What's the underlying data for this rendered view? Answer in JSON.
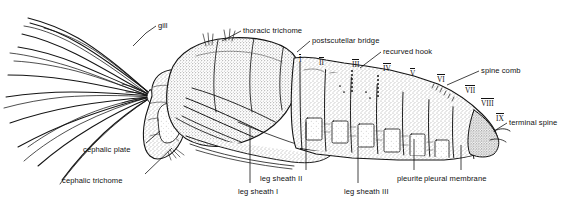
{
  "figure": {
    "view": "lateral",
    "background": "#ffffff",
    "ink": "#111111"
  },
  "labels": [
    {
      "id": "gill",
      "text": "gill",
      "x": 158,
      "y": 22,
      "anchor": "start"
    },
    {
      "id": "thoracic-trichome",
      "text": "thoracic trichome",
      "x": 243,
      "y": 27,
      "anchor": "start"
    },
    {
      "id": "postscutellar",
      "text": "postscutellar bridge",
      "x": 312,
      "y": 37,
      "anchor": "start"
    },
    {
      "id": "recurved-hook",
      "text": "recurved hook",
      "x": 383,
      "y": 48,
      "anchor": "start"
    },
    {
      "id": "spine-comb",
      "text": "spine comb",
      "x": 481,
      "y": 67,
      "anchor": "start"
    },
    {
      "id": "terminal-spine",
      "text": "terminal spine",
      "x": 509,
      "y": 119,
      "anchor": "start"
    },
    {
      "id": "cephalic-plate",
      "text": "cephalic plate",
      "x": 83,
      "y": 146,
      "anchor": "start"
    },
    {
      "id": "cephalic-trichome",
      "text": "cephalic trichome",
      "x": 62,
      "y": 177,
      "anchor": "start"
    },
    {
      "id": "leg-sheath-1",
      "text": "leg sheath I",
      "x": 238,
      "y": 188,
      "anchor": "start"
    },
    {
      "id": "leg-sheath-2",
      "text": "leg sheath II",
      "x": 260,
      "y": 175,
      "anchor": "start"
    },
    {
      "id": "leg-sheath-3",
      "text": "leg sheath III",
      "x": 344,
      "y": 188,
      "anchor": "start"
    },
    {
      "id": "pleurite",
      "text": "pleurite",
      "x": 397,
      "y": 175,
      "anchor": "start"
    },
    {
      "id": "pleural-membrane",
      "text": "pleural membrane",
      "x": 424,
      "y": 175,
      "anchor": "start"
    }
  ],
  "segments": [
    {
      "numeral": "I",
      "x": 299,
      "y": 54
    },
    {
      "numeral": "II",
      "x": 319,
      "y": 57
    },
    {
      "numeral": "III",
      "x": 352,
      "y": 59
    },
    {
      "numeral": "IV",
      "x": 383,
      "y": 63
    },
    {
      "numeral": "V",
      "x": 410,
      "y": 68
    },
    {
      "numeral": "VI",
      "x": 437,
      "y": 74
    },
    {
      "numeral": "VII",
      "x": 465,
      "y": 85
    },
    {
      "numeral": "VIII",
      "x": 481,
      "y": 98
    },
    {
      "numeral": "IX",
      "x": 496,
      "y": 113
    }
  ],
  "leaders": [
    {
      "id": "gill",
      "path": "M156 26 L146 33 L133 46"
    },
    {
      "id": "thoracic-trichome",
      "path": "M241 31 L222 41"
    },
    {
      "id": "postscutellar",
      "path": "M310 41 L297 52"
    },
    {
      "id": "recurved-hook",
      "path": "M381 52 L360 68"
    },
    {
      "id": "spine-comb",
      "path": "M479 71 L447 85"
    },
    {
      "id": "terminal-spine",
      "path": "M507 123 L494 131"
    },
    {
      "id": "cephalic-plate",
      "path": "M146 143 L160 131"
    },
    {
      "id": "cephalic-trichome",
      "path": "M145 174 L172 148"
    },
    {
      "id": "leg-sheath-1",
      "path": "M250 183 L250 127"
    },
    {
      "id": "leg-sheath-2",
      "path": "M306 170 L306 122"
    },
    {
      "id": "leg-sheath-3",
      "path": "M358 183 L358 147"
    },
    {
      "id": "pleurite",
      "path": "M414 170 L414 139"
    },
    {
      "id": "pleural-membrane",
      "path": "M461 170 L461 145"
    }
  ]
}
